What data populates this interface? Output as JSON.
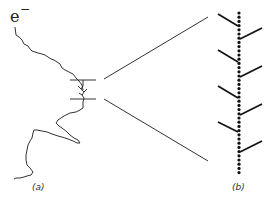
{
  "figure": {
    "particle_label": "e",
    "particle_charge": "−",
    "panels": [
      {
        "id": "a",
        "label": "(a)",
        "description": "Electron track with secondary branches (delta rays)"
      },
      {
        "id": "b",
        "label": "(b)",
        "description": "Magnified section: ionization dots with delta-ray branches"
      }
    ],
    "magnified_branches": {
      "left_branches": 3,
      "right_branches": 3
    },
    "colors": {
      "stroke": "#333333",
      "dots": "#111111",
      "background": "#ffffff"
    }
  }
}
